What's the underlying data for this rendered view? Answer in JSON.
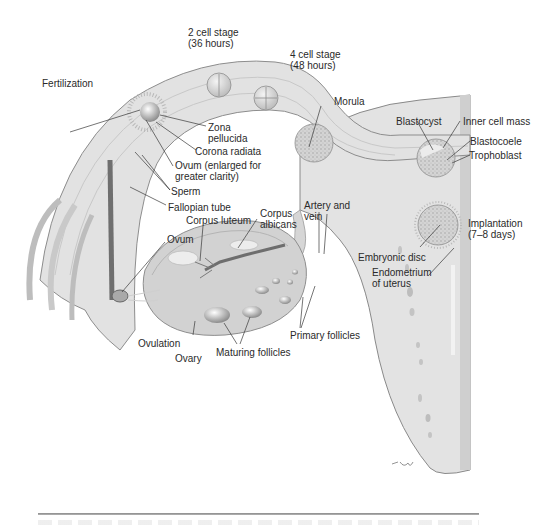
{
  "figure": {
    "labels": {
      "fertilization": "Fertilization",
      "two_cell_stage": "2 cell stage\n(36 hours)",
      "four_cell_stage": "4 cell stage\n(48 hours)",
      "morula": "Morula",
      "zona_pellucida": "Zona\npellucida",
      "corona_radiata": "Corona radiata",
      "ovum_enlarged": "Ovum (enlarged for\ngreater clarity)",
      "sperm": "Sperm",
      "fallopian_tube": "Fallopian tube",
      "corpus_luteum": "Corpus luteum",
      "corpus_albicans": "Corpus\nalbicans",
      "artery_and_vein": "Artery and\nvein",
      "ovum": "Ovum",
      "blastocyst": "Blastocyst",
      "inner_cell_mass": "Inner cell mass",
      "blastocoele": "Blastocoele",
      "trophoblast": "Trophoblast",
      "implantation": "Implantation\n(7–8 days)",
      "embryonic_disc": "Embryonic disc",
      "endometrium": "Endometrium\nof uterus",
      "primary_follicles": "Primary follicles",
      "ovulation": "Ovulation",
      "ovary": "Ovary",
      "maturing_follicles": "Maturing follicles"
    },
    "colors": {
      "tissue_light": "#e6e6e6",
      "tissue_mid": "#cfcfcf",
      "tissue_dark": "#9a9a9a",
      "outline": "#7a7a7a",
      "vessel": "#6e6e6e",
      "text": "#2a2a2a"
    }
  }
}
